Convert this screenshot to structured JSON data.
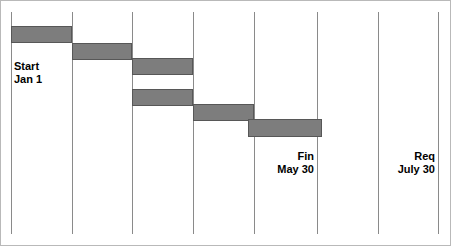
{
  "chart_data": {
    "type": "bar",
    "chart_kind": "gantt",
    "title": "",
    "subtitle": "",
    "xlabel": "",
    "ylabel": "",
    "grid": true,
    "gridlines_x": [
      11,
      72,
      132,
      193,
      254,
      317,
      378,
      438
    ],
    "xlim": [
      0,
      451
    ],
    "legend": "none",
    "bar_color": "#7d7d7d",
    "bar_border_color": "#575757",
    "gridline_color": "#8a8a8a",
    "frame_color": "#b9b9b9",
    "background_color": "#ffffff",
    "categories": [
      "Task 1",
      "Task 2",
      "Task 3",
      "Task 4",
      "Task 5",
      "Task 6"
    ],
    "tasks": [
      {
        "label": "Task 1",
        "start": 11,
        "end": 72,
        "top": 26,
        "height": 17,
        "duration": 61
      },
      {
        "label": "Task 2",
        "start": 72,
        "end": 132,
        "top": 43,
        "height": 17,
        "duration": 60
      },
      {
        "label": "Task 3",
        "start": 132,
        "end": 193,
        "top": 58,
        "height": 17,
        "duration": 61
      },
      {
        "label": "Task 4",
        "start": 132,
        "end": 193,
        "top": 89,
        "height": 17,
        "duration": 61
      },
      {
        "label": "Task 5",
        "start": 193,
        "end": 254,
        "top": 104,
        "height": 17,
        "duration": 61
      },
      {
        "label": "Task 6",
        "start": 248,
        "end": 322,
        "top": 119,
        "height": 18,
        "duration": 74
      }
    ],
    "annotations": [
      {
        "name": "start",
        "line1": "Start",
        "line2": "Jan 1",
        "x": 14,
        "y": 60,
        "align": "left",
        "gridline_x": 11
      },
      {
        "name": "finish",
        "line1": "Fin",
        "line2": "May 30",
        "x": 314,
        "y": 150,
        "align": "right",
        "gridline_x": 317
      },
      {
        "name": "required",
        "line1": "Req",
        "line2": "July 30",
        "x": 435,
        "y": 150,
        "align": "right",
        "gridline_x": 438
      }
    ]
  },
  "annotations": {
    "start": {
      "line1": "Start",
      "line2": "Jan 1"
    },
    "finish": {
      "line1": "Fin",
      "line2": "May 30"
    },
    "required": {
      "line1": "Req",
      "line2": "July 30"
    }
  }
}
